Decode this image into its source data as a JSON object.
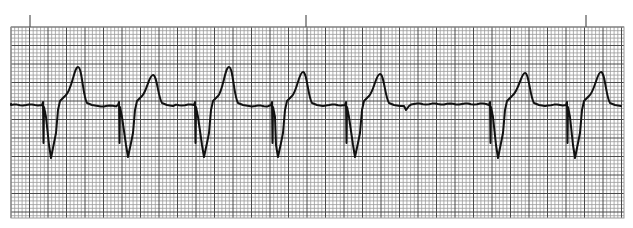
{
  "chart_data": {
    "type": "line",
    "title": "",
    "xlabel": "",
    "ylabel": "",
    "grid": true,
    "grid_box": {
      "x0": 11,
      "y0": 27,
      "x1": 624,
      "y1": 218
    },
    "small_square_px": 3.7,
    "major_every": 5,
    "baseline_y": 105,
    "time_marker_ticks_x": [
      30,
      306,
      586
    ],
    "beats": [
      {
        "index": 1,
        "pacer_spike_x": 42,
        "qrs_nadir_x": 51,
        "qrs_nadir_y": 158,
        "t_peak_x": 78,
        "t_peak_y": 67
      },
      {
        "index": 2,
        "pacer_spike_x": 118,
        "qrs_nadir_x": 128,
        "qrs_nadir_y": 157,
        "t_peak_x": 153,
        "t_peak_y": 75
      },
      {
        "index": 3,
        "pacer_spike_x": 194,
        "qrs_nadir_x": 204,
        "qrs_nadir_y": 157,
        "t_peak_x": 229,
        "t_peak_y": 67
      },
      {
        "index": 4,
        "pacer_spike_x": 271,
        "qrs_nadir_x": 278,
        "qrs_nadir_y": 157,
        "t_peak_x": 303,
        "t_peak_y": 72
      },
      {
        "index": 5,
        "pacer_spike_x": 345,
        "qrs_nadir_x": 355,
        "qrs_nadir_y": 157,
        "t_peak_x": 380,
        "t_peak_y": 74
      },
      {
        "index": 6,
        "pacer_spike_x": 489,
        "qrs_nadir_x": 498,
        "qrs_nadir_y": 158,
        "t_peak_x": 525,
        "t_peak_y": 73
      },
      {
        "index": 7,
        "pacer_spike_x": 566,
        "qrs_nadir_x": 575,
        "qrs_nadir_y": 158,
        "t_peak_x": 601,
        "t_peak_y": 72
      }
    ],
    "pause_blip": {
      "x": 406,
      "y": 110
    },
    "trace_start": {
      "x": 11,
      "y": 104
    },
    "trace_end": {
      "x": 622,
      "y": 104
    }
  },
  "colors": {
    "background": "#ffffff",
    "grid_minor": "#9a9a9a",
    "grid_major": "#4a4a4a",
    "trace": "#111111",
    "tick": "#555555"
  }
}
